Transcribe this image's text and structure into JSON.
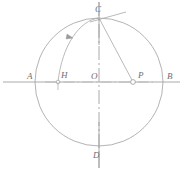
{
  "figure": {
    "background_color": "#ffffff",
    "stroke_color": "#9a9a9a",
    "label_color": "#6e6e6e",
    "center": {
      "x": 99,
      "y": 82
    },
    "radius": 64
  },
  "labels": {
    "A": "A",
    "B": "B",
    "C": "C",
    "D": "D",
    "O": "O",
    "H": "H",
    "P": "P"
  },
  "points": {
    "A": {
      "x": 35,
      "y": 82,
      "label_x": 27,
      "label_y": 79
    },
    "B": {
      "x": 163,
      "y": 82,
      "label_x": 167,
      "label_y": 79
    },
    "C": {
      "x": 99,
      "y": 18,
      "label_x": 95,
      "label_y": 12
    },
    "D": {
      "x": 99,
      "y": 146,
      "label_x": 93,
      "label_y": 158
    },
    "O": {
      "x": 99,
      "y": 82,
      "label_x": 91,
      "label_y": 79
    },
    "H": {
      "x": 58,
      "y": 82,
      "label_x": 61,
      "label_y": 78
    },
    "P": {
      "x": 133,
      "y": 82,
      "label_x": 138,
      "label_y": 78
    }
  },
  "elements": {
    "main_circle": "circle-AB-CD",
    "horizontal_axis": "diameter-A-B",
    "vertical_axis": "center-line-C-D",
    "construction_arc": "arc-C-to-H",
    "arc_arrowhead": "arrowhead-on-arc",
    "chord": "segment-C-to-P",
    "tangent": "tangent-at-C",
    "p_marker": "small-circle-at-P",
    "h_tick": "tick-below-H"
  },
  "geometry": {
    "axis_line_style": "dash-dot",
    "circle_line_style": "solid",
    "arc_line_style": "solid",
    "stroke_width": 0.8
  }
}
